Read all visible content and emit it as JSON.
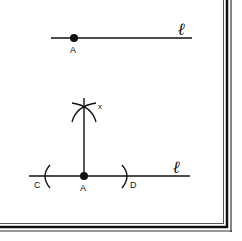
{
  "figure": {
    "top_diagram": {
      "line_label": "ℓ",
      "point_label": "A"
    },
    "bottom_diagram": {
      "line_label": "ℓ",
      "point_label": "A",
      "left_arc_label": "C",
      "right_arc_label": "D",
      "intersection_label": "x"
    }
  },
  "colors": {
    "ink": "#111111",
    "background": "#ffffff",
    "frame_light": "#888888"
  }
}
